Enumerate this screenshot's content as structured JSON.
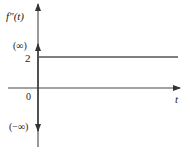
{
  "diagram": {
    "y_axis_label": "f″(t)",
    "x_axis_label": "t",
    "origin_label": "0",
    "step_value_label": "2",
    "impulse_up_label": "(∞)",
    "impulse_down_label": "(−∞)",
    "step_value": 2,
    "colors": {
      "axis": "#333333",
      "line": "#555555"
    }
  }
}
